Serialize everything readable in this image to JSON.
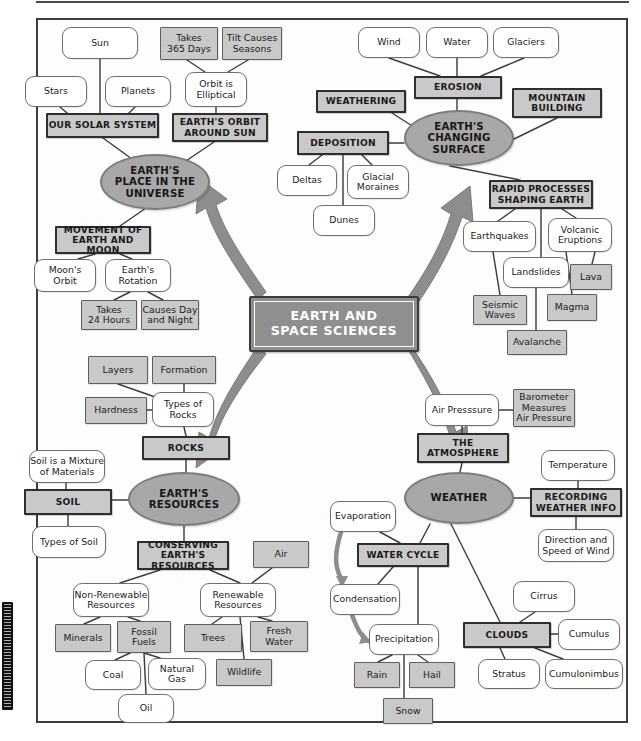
{
  "title": "EARTH AND\nSPACE SCIENCES",
  "colors": {
    "oval_fill": "#a8a8a8",
    "gray_fill": "#c9c9c9",
    "center_fill": "#8f8f8f",
    "arrow_fill": "#8d8d8d",
    "line": "#3d3d3d",
    "white_fill": "#ffffff",
    "text": "#1b1b1b",
    "center_text": "#ffffff"
  },
  "strands": [
    {
      "id": "place",
      "label": "EARTH'S\nPLACE IN THE\nUNIVERSE",
      "x": 100,
      "y": 154,
      "w": 110,
      "h": 56
    },
    {
      "id": "changing",
      "label": "EARTH'S\nCHANGING\nSURFACE",
      "x": 404,
      "y": 110,
      "w": 110,
      "h": 56
    },
    {
      "id": "resources",
      "label": "EARTH'S\nRESOURCES",
      "x": 128,
      "y": 472,
      "w": 112,
      "h": 54
    },
    {
      "id": "weather",
      "label": "WEATHER",
      "x": 404,
      "y": 472,
      "w": 110,
      "h": 52
    }
  ],
  "nodes": [
    {
      "id": "sun",
      "label": "Sun",
      "type": "round",
      "x": 62,
      "y": 27,
      "w": 76,
      "h": 32
    },
    {
      "id": "stars",
      "label": "Stars",
      "type": "round",
      "x": 25,
      "y": 76,
      "w": 62,
      "h": 31
    },
    {
      "id": "planets",
      "label": "Planets",
      "type": "round",
      "x": 105,
      "y": 76,
      "w": 66,
      "h": 31
    },
    {
      "id": "our-solar-system",
      "label": "OUR SOLAR SYSTEM",
      "type": "head",
      "x": 46,
      "y": 113,
      "w": 113,
      "h": 25
    },
    {
      "id": "takes-365-days",
      "label": "Takes\n365 Days",
      "type": "gray",
      "x": 160,
      "y": 27,
      "w": 58,
      "h": 33
    },
    {
      "id": "tilt-seasons",
      "label": "Tilt Causes\nSeasons",
      "type": "gray",
      "x": 222,
      "y": 27,
      "w": 60,
      "h": 33
    },
    {
      "id": "orbit-elliptical",
      "label": "Orbit is\nElliptical",
      "type": "round",
      "x": 185,
      "y": 72,
      "w": 62,
      "h": 35
    },
    {
      "id": "earths-orbit",
      "label": "EARTH'S ORBIT\nAROUND SUN",
      "type": "head",
      "x": 172,
      "y": 113,
      "w": 96,
      "h": 29
    },
    {
      "id": "movement",
      "label": "MOVEMENT OF\nEARTH AND MOON",
      "type": "head",
      "x": 55,
      "y": 226,
      "w": 96,
      "h": 28
    },
    {
      "id": "moons-orbit",
      "label": "Moon's\nOrbit",
      "type": "round",
      "x": 34,
      "y": 259,
      "w": 62,
      "h": 33
    },
    {
      "id": "earths-rotation",
      "label": "Earth's\nRotation",
      "type": "round",
      "x": 105,
      "y": 259,
      "w": 66,
      "h": 33
    },
    {
      "id": "takes-24-hours",
      "label": "Takes\n24 Hours",
      "type": "gray",
      "x": 81,
      "y": 300,
      "w": 56,
      "h": 30
    },
    {
      "id": "causes-day-night",
      "label": "Causes Day\nand Night",
      "type": "gray",
      "x": 141,
      "y": 300,
      "w": 58,
      "h": 30
    },
    {
      "id": "wind",
      "label": "Wind",
      "type": "round",
      "x": 358,
      "y": 27,
      "w": 62,
      "h": 31
    },
    {
      "id": "water",
      "label": "Water",
      "type": "round",
      "x": 426,
      "y": 27,
      "w": 62,
      "h": 31
    },
    {
      "id": "glaciers",
      "label": "Glaciers",
      "type": "round",
      "x": 493,
      "y": 27,
      "w": 66,
      "h": 31
    },
    {
      "id": "erosion",
      "label": "EROSION",
      "type": "head",
      "x": 414,
      "y": 76,
      "w": 88,
      "h": 23
    },
    {
      "id": "weathering",
      "label": "WEATHERING",
      "type": "head",
      "x": 316,
      "y": 90,
      "w": 90,
      "h": 23
    },
    {
      "id": "mountain-building",
      "label": "MOUNTAIN\nBUILDING",
      "type": "head",
      "x": 512,
      "y": 88,
      "w": 90,
      "h": 30
    },
    {
      "id": "deposition",
      "label": "DEPOSITION",
      "type": "head",
      "x": 297,
      "y": 131,
      "w": 92,
      "h": 24
    },
    {
      "id": "deltas",
      "label": "Deltas",
      "type": "round",
      "x": 277,
      "y": 165,
      "w": 60,
      "h": 31
    },
    {
      "id": "glacial-moraines",
      "label": "Glacial\nMoraines",
      "type": "round",
      "x": 347,
      "y": 165,
      "w": 62,
      "h": 34
    },
    {
      "id": "dunes",
      "label": "Dunes",
      "type": "round",
      "x": 313,
      "y": 205,
      "w": 62,
      "h": 31
    },
    {
      "id": "rapid-processes",
      "label": "RAPID PROCESSES\nSHAPING EARTH",
      "type": "head",
      "x": 489,
      "y": 180,
      "w": 104,
      "h": 29
    },
    {
      "id": "earthquakes",
      "label": "Earthquakes",
      "type": "round",
      "x": 463,
      "y": 221,
      "w": 73,
      "h": 31
    },
    {
      "id": "volcanic",
      "label": "Volcanic\nEruptions",
      "type": "round",
      "x": 548,
      "y": 218,
      "w": 64,
      "h": 34
    },
    {
      "id": "landslides",
      "label": "Landslides",
      "type": "round",
      "x": 503,
      "y": 257,
      "w": 66,
      "h": 31
    },
    {
      "id": "lava",
      "label": "Lava",
      "type": "gray",
      "x": 570,
      "y": 264,
      "w": 42,
      "h": 26
    },
    {
      "id": "seismic-waves",
      "label": "Seismic\nWaves",
      "type": "gray",
      "x": 473,
      "y": 295,
      "w": 54,
      "h": 30
    },
    {
      "id": "magma",
      "label": "Magma",
      "type": "gray",
      "x": 547,
      "y": 294,
      "w": 50,
      "h": 27
    },
    {
      "id": "avalanche",
      "label": "Avalanche",
      "type": "gray",
      "x": 507,
      "y": 330,
      "w": 60,
      "h": 25
    },
    {
      "id": "layers",
      "label": "Layers",
      "type": "gray",
      "x": 88,
      "y": 356,
      "w": 60,
      "h": 28
    },
    {
      "id": "formation",
      "label": "Formation",
      "type": "gray",
      "x": 152,
      "y": 356,
      "w": 64,
      "h": 28
    },
    {
      "id": "hardness",
      "label": "Hardness",
      "type": "gray",
      "x": 85,
      "y": 397,
      "w": 62,
      "h": 27
    },
    {
      "id": "types-of-rocks",
      "label": "Types of\nRocks",
      "type": "round",
      "x": 152,
      "y": 392,
      "w": 62,
      "h": 35
    },
    {
      "id": "rocks",
      "label": "ROCKS",
      "type": "head",
      "x": 142,
      "y": 436,
      "w": 88,
      "h": 24
    },
    {
      "id": "soil-mixture",
      "label": "Soil is a Mixture\nof Materials",
      "type": "round",
      "x": 29,
      "y": 450,
      "w": 76,
      "h": 33
    },
    {
      "id": "soil",
      "label": "SOIL",
      "type": "head",
      "x": 24,
      "y": 489,
      "w": 88,
      "h": 26
    },
    {
      "id": "types-of-soil",
      "label": "Types of Soil",
      "type": "round",
      "x": 32,
      "y": 526,
      "w": 74,
      "h": 32
    },
    {
      "id": "conserving",
      "label": "CONSERVING\nEARTH'S RESOURCES",
      "type": "head",
      "x": 137,
      "y": 541,
      "w": 92,
      "h": 29
    },
    {
      "id": "air",
      "label": "Air",
      "type": "gray",
      "x": 253,
      "y": 541,
      "w": 56,
      "h": 27
    },
    {
      "id": "non-renewable",
      "label": "Non-Renewable\nResources",
      "type": "round",
      "x": 73,
      "y": 583,
      "w": 76,
      "h": 34
    },
    {
      "id": "renewable",
      "label": "Renewable\nResources",
      "type": "round",
      "x": 200,
      "y": 583,
      "w": 76,
      "h": 34
    },
    {
      "id": "minerals",
      "label": "Minerals",
      "type": "gray",
      "x": 55,
      "y": 624,
      "w": 56,
      "h": 28
    },
    {
      "id": "fossil-fuels",
      "label": "Fossil\nFuels",
      "type": "gray",
      "x": 117,
      "y": 621,
      "w": 54,
      "h": 32
    },
    {
      "id": "trees",
      "label": "Trees",
      "type": "gray",
      "x": 184,
      "y": 624,
      "w": 58,
      "h": 28
    },
    {
      "id": "fresh-water",
      "label": "Fresh\nWater",
      "type": "gray",
      "x": 250,
      "y": 621,
      "w": 58,
      "h": 31
    },
    {
      "id": "coal",
      "label": "Coal",
      "type": "round",
      "x": 85,
      "y": 660,
      "w": 56,
      "h": 30
    },
    {
      "id": "natural-gas",
      "label": "Natural\nGas",
      "type": "round",
      "x": 148,
      "y": 658,
      "w": 58,
      "h": 32
    },
    {
      "id": "wildlife",
      "label": "Wildlife",
      "type": "gray",
      "x": 216,
      "y": 659,
      "w": 56,
      "h": 27
    },
    {
      "id": "oil",
      "label": "Oil",
      "type": "round",
      "x": 118,
      "y": 694,
      "w": 56,
      "h": 29
    },
    {
      "id": "air-pressure",
      "label": "Air Presssure",
      "type": "round",
      "x": 425,
      "y": 394,
      "w": 74,
      "h": 32
    },
    {
      "id": "barometer",
      "label": "Barometer\nMeasures\nAir Pressure",
      "type": "gray",
      "x": 513,
      "y": 389,
      "w": 62,
      "h": 38
    },
    {
      "id": "the-atmosphere",
      "label": "THE\nATMOSPHERE",
      "type": "head",
      "x": 417,
      "y": 433,
      "w": 92,
      "h": 30
    },
    {
      "id": "temperature",
      "label": "Temperature",
      "type": "round",
      "x": 541,
      "y": 450,
      "w": 74,
      "h": 31
    },
    {
      "id": "recording",
      "label": "RECORDING\nWEATHER INFO",
      "type": "head",
      "x": 530,
      "y": 488,
      "w": 92,
      "h": 29
    },
    {
      "id": "direction-speed",
      "label": "Direction and\nSpeed of Wind",
      "type": "round",
      "x": 538,
      "y": 529,
      "w": 76,
      "h": 33
    },
    {
      "id": "evaporation",
      "label": "Evaporation",
      "type": "round",
      "x": 330,
      "y": 501,
      "w": 66,
      "h": 31
    },
    {
      "id": "water-cycle",
      "label": "WATER CYCLE",
      "type": "head",
      "x": 357,
      "y": 543,
      "w": 92,
      "h": 24
    },
    {
      "id": "condensation",
      "label": "Condensation",
      "type": "round",
      "x": 330,
      "y": 584,
      "w": 70,
      "h": 31
    },
    {
      "id": "precipitation",
      "label": "Precipitation",
      "type": "round",
      "x": 369,
      "y": 624,
      "w": 70,
      "h": 31
    },
    {
      "id": "cirrus",
      "label": "Cirrus",
      "type": "round",
      "x": 513,
      "y": 581,
      "w": 62,
      "h": 31
    },
    {
      "id": "clouds",
      "label": "CLOUDS",
      "type": "head",
      "x": 463,
      "y": 622,
      "w": 88,
      "h": 26
    },
    {
      "id": "cumulus",
      "label": "Cumulus",
      "type": "round",
      "x": 558,
      "y": 619,
      "w": 62,
      "h": 31
    },
    {
      "id": "rain",
      "label": "Rain",
      "type": "gray",
      "x": 354,
      "y": 662,
      "w": 46,
      "h": 26
    },
    {
      "id": "hail",
      "label": "Hail",
      "type": "gray",
      "x": 409,
      "y": 662,
      "w": 46,
      "h": 26
    },
    {
      "id": "stratus",
      "label": "Stratus",
      "type": "round",
      "x": 478,
      "y": 659,
      "w": 62,
      "h": 30
    },
    {
      "id": "cumulonimbus",
      "label": "Cumulonimbus",
      "type": "round",
      "x": 545,
      "y": 659,
      "w": 78,
      "h": 30
    },
    {
      "id": "snow",
      "label": "Snow",
      "type": "gray",
      "x": 383,
      "y": 698,
      "w": 50,
      "h": 26
    }
  ]
}
